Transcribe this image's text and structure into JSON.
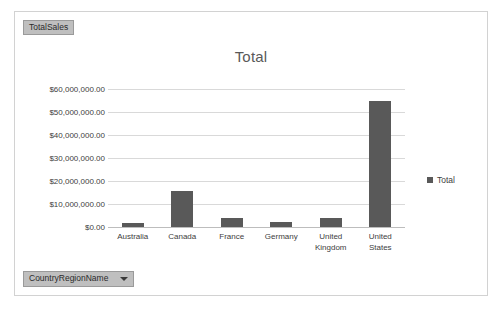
{
  "frame": {
    "legend_field_button": "TotalSales",
    "axis_field_button": "CountryRegionName",
    "caret_icon": "chevron-down-icon"
  },
  "chart_data": {
    "type": "bar",
    "title": "Total",
    "xlabel": "",
    "ylabel": "",
    "categories": [
      "Australia",
      "Canada",
      "France",
      "Germany",
      "United Kingdom",
      "United States"
    ],
    "series": [
      {
        "name": "Total",
        "values": [
          1700000,
          15600000,
          4000000,
          2200000,
          4100000,
          54800000
        ]
      }
    ],
    "ylim": [
      0,
      60000000
    ],
    "ytick_values": [
      0,
      10000000,
      20000000,
      30000000,
      40000000,
      50000000,
      60000000
    ],
    "ytick_labels": [
      "$0.00",
      "$10,000,000.00",
      "$20,000,000.00",
      "$30,000,000.00",
      "$40,000,000.00",
      "$50,000,000.00",
      "$60,000,000.00"
    ],
    "grid": true,
    "legend_position": "right",
    "legend_entries": [
      "Total"
    ],
    "bar_color": "#595959",
    "gridline_color": "#d9d9d9",
    "title_color": "#595959"
  }
}
